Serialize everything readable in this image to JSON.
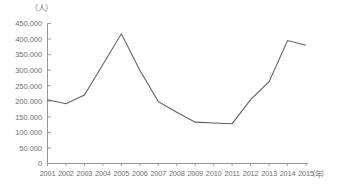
{
  "chart_data": {
    "type": "line",
    "title": "",
    "subtitle": "",
    "xlabel": "（年）",
    "ylabel": "（人）",
    "grid": false,
    "legend": "none",
    "xlim": [
      "2001",
      "2015"
    ],
    "ylim": [
      0,
      450000
    ],
    "ytick_step": 50000,
    "categories": [
      "2001",
      "2002",
      "2003",
      "2004",
      "2005",
      "2006",
      "2007",
      "2008",
      "2009",
      "2010",
      "2011",
      "2012",
      "2013",
      "2014",
      "2015"
    ],
    "values": [
      205000,
      192000,
      220000,
      318000,
      417000,
      300000,
      199000,
      165000,
      133000,
      130000,
      128000,
      205000,
      263000,
      395000,
      380000
    ],
    "ytick_labels": [
      "450.000",
      "400.000",
      "350.000",
      "300.000",
      "250.000",
      "200.000",
      "150.000",
      "100.000",
      "50.000",
      "0"
    ],
    "ytick_values": [
      450000,
      400000,
      350000,
      300000,
      250000,
      200000,
      150000,
      100000,
      50000,
      0
    ],
    "series": [
      {
        "name": "",
        "color": "#5e5e5e",
        "values": [
          205000,
          192000,
          220000,
          318000,
          417000,
          300000,
          199000,
          165000,
          133000,
          130000,
          128000,
          205000,
          263000,
          395000,
          380000
        ]
      }
    ],
    "annotations": []
  },
  "axis": {
    "y_unit": "（人）",
    "x_unit": "（年）"
  }
}
